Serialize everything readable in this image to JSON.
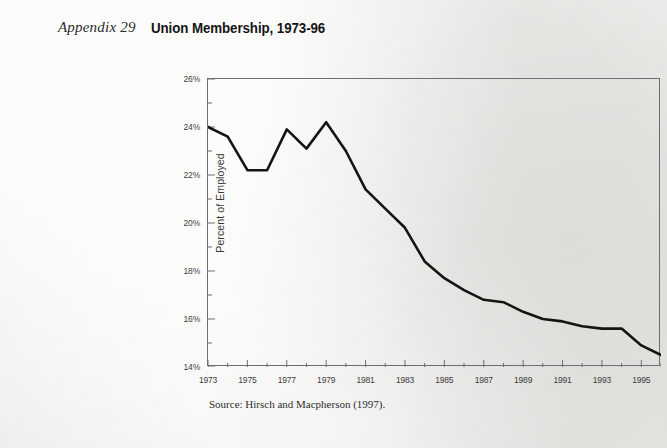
{
  "header": {
    "appendix_label": "Appendix 29",
    "title": "Union Membership, 1973-96"
  },
  "source_note": "Source: Hirsch and Macpherson (1997).",
  "style": {
    "line_color": "#141414",
    "axis_color": "#6e6e6e",
    "text_color": "#3d3d3d",
    "page_background": "#f2f2f0"
  },
  "chart_data": {
    "type": "line",
    "title": "Union Membership, 1973-96",
    "xlabel": "",
    "ylabel": "Percent of Employed",
    "xlim": [
      1973,
      1996
    ],
    "ylim": [
      14,
      26
    ],
    "ytick_values": [
      14,
      16,
      18,
      20,
      22,
      24,
      26
    ],
    "ytick_labels": [
      "14%",
      "16%",
      "18%",
      "20%",
      "22%",
      "24%",
      "26%"
    ],
    "y_minor_tick_step": 1,
    "xtick_values": [
      1973,
      1975,
      1977,
      1979,
      1981,
      1983,
      1985,
      1987,
      1989,
      1991,
      1993,
      1995
    ],
    "xtick_labels": [
      "1973",
      "1975",
      "1977",
      "1979",
      "1981",
      "1983",
      "1985",
      "1987",
      "1989",
      "1991",
      "1993",
      "1995"
    ],
    "x_minor_tick_step": 1,
    "grid": false,
    "legend": false,
    "series": [
      {
        "name": "Union Membership",
        "x": [
          1973,
          1974,
          1975,
          1976,
          1977,
          1978,
          1979,
          1980,
          1981,
          1982,
          1983,
          1984,
          1985,
          1986,
          1987,
          1988,
          1989,
          1990,
          1991,
          1992,
          1993,
          1994,
          1995,
          1996
        ],
        "values": [
          24.0,
          23.6,
          22.2,
          22.2,
          23.9,
          23.1,
          24.2,
          23.0,
          21.4,
          20.6,
          19.8,
          18.4,
          17.7,
          17.2,
          16.8,
          16.7,
          16.3,
          16.0,
          15.9,
          15.7,
          15.6,
          15.6,
          14.9,
          14.5
        ]
      }
    ]
  }
}
